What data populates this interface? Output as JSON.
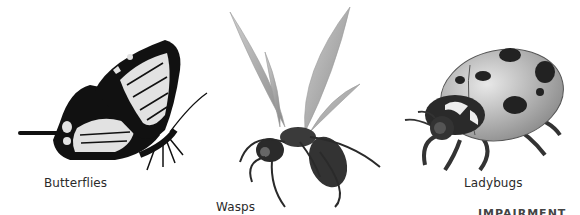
{
  "panels": [
    {
      "name": "butterfly",
      "label": "Butterflies",
      "icon": "butterfly-icon"
    },
    {
      "name": "wasp",
      "label": "Wasps",
      "icon": "wasp-icon"
    },
    {
      "name": "ladybug",
      "label": "Ladybugs",
      "icon": "ladybug-icon"
    }
  ],
  "footer_fragment": "IMPAIRMENT"
}
